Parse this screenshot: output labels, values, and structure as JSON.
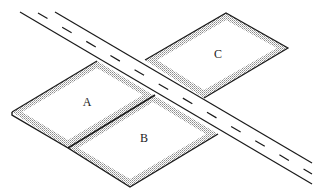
{
  "diagram": {
    "colors": {
      "line": "#1a1a1a",
      "shade": "#9a9a9a",
      "background": "#ffffff"
    },
    "road": {
      "name": "road",
      "has_center_dashed_line": true
    },
    "plots": [
      {
        "id": "A",
        "label": "A",
        "x": 87,
        "y": 102
      },
      {
        "id": "B",
        "label": "B",
        "x": 144,
        "y": 138
      },
      {
        "id": "C",
        "label": "C",
        "x": 218,
        "y": 54
      }
    ]
  }
}
